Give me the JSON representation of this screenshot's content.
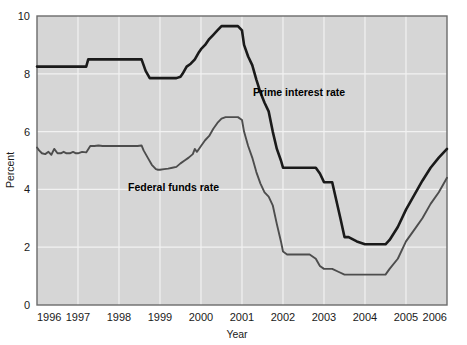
{
  "chart_data": {
    "type": "line",
    "title": "",
    "subtitle": "",
    "xlabel": "Year",
    "ylabel": "Percent",
    "xlim": [
      1996,
      2006
    ],
    "ylim": [
      0,
      10
    ],
    "grid": true,
    "legend_position": "inline-annotations",
    "xticks": [
      "1996",
      "1997",
      "1998",
      "1999",
      "2000",
      "2001",
      "2002",
      "2003",
      "2004",
      "2005",
      "2006"
    ],
    "yticks": [
      "0",
      "2",
      "4",
      "6",
      "8",
      "10"
    ],
    "series": [
      {
        "name": "Prime interest rate",
        "color": "#1a1a1a",
        "annotation": "Prime interest rate",
        "x": [
          1996.0,
          1996.1,
          1996.2,
          1996.3,
          1996.4,
          1996.5,
          1996.6,
          1996.7,
          1996.8,
          1996.9,
          1997.0,
          1997.1,
          1997.2,
          1997.25,
          1997.3,
          1997.5,
          1997.7,
          1997.9,
          1998.0,
          1998.2,
          1998.4,
          1998.55,
          1998.65,
          1998.75,
          1998.85,
          1998.95,
          1999.0,
          1999.2,
          1999.4,
          1999.5,
          1999.55,
          1999.65,
          1999.75,
          1999.85,
          1999.95,
          2000.0,
          2000.1,
          2000.2,
          2000.3,
          2000.4,
          2000.5,
          2000.6,
          2000.75,
          2000.9,
          2001.0,
          2001.05,
          2001.15,
          2001.25,
          2001.35,
          2001.45,
          2001.55,
          2001.65,
          2001.75,
          2001.85,
          2001.95,
          2002.0,
          2002.2,
          2002.4,
          2002.6,
          2002.8,
          2002.9,
          2003.0,
          2003.05,
          2003.2,
          2003.4,
          2003.5,
          2003.6,
          2003.8,
          2004.0,
          2004.2,
          2004.4,
          2004.5,
          2004.6,
          2004.8,
          2005.0,
          2005.2,
          2005.4,
          2005.6,
          2005.8,
          2006.0
        ],
        "values": [
          8.25,
          8.25,
          8.25,
          8.25,
          8.25,
          8.25,
          8.25,
          8.25,
          8.25,
          8.25,
          8.25,
          8.25,
          8.25,
          8.5,
          8.5,
          8.5,
          8.5,
          8.5,
          8.5,
          8.5,
          8.5,
          8.5,
          8.1,
          7.85,
          7.85,
          7.85,
          7.85,
          7.85,
          7.85,
          7.9,
          8.0,
          8.25,
          8.35,
          8.5,
          8.75,
          8.85,
          9.0,
          9.2,
          9.35,
          9.5,
          9.65,
          9.65,
          9.65,
          9.65,
          9.5,
          9.0,
          8.6,
          8.3,
          7.8,
          7.35,
          7.0,
          6.7,
          6.0,
          5.4,
          5.0,
          4.75,
          4.75,
          4.75,
          4.75,
          4.75,
          4.55,
          4.25,
          4.25,
          4.25,
          3.0,
          2.35,
          2.35,
          2.2,
          2.1,
          2.1,
          2.1,
          2.1,
          2.25,
          2.7,
          3.3,
          3.8,
          4.3,
          4.75,
          5.1,
          5.4
        ]
      },
      {
        "name": "Federal funds rate",
        "color": "#4d4d4d",
        "annotation": "Federal funds rate",
        "x": [
          1996.0,
          1996.05,
          1996.12,
          1996.2,
          1996.28,
          1996.35,
          1996.42,
          1996.5,
          1996.58,
          1996.65,
          1996.72,
          1996.8,
          1996.88,
          1996.95,
          1997.0,
          1997.1,
          1997.2,
          1997.3,
          1997.4,
          1997.5,
          1997.6,
          1997.75,
          1997.9,
          1998.0,
          1998.15,
          1998.3,
          1998.45,
          1998.55,
          1998.6,
          1998.7,
          1998.8,
          1998.9,
          1998.95,
          1999.0,
          1999.1,
          1999.2,
          1999.3,
          1999.4,
          1999.5,
          1999.6,
          1999.7,
          1999.8,
          1999.85,
          1999.9,
          1999.95,
          2000.0,
          2000.1,
          2000.2,
          2000.3,
          2000.4,
          2000.5,
          2000.6,
          2000.7,
          2000.8,
          2000.9,
          2001.0,
          2001.05,
          2001.15,
          2001.25,
          2001.35,
          2001.45,
          2001.55,
          2001.65,
          2001.75,
          2001.85,
          2001.95,
          2002.0,
          2002.1,
          2002.3,
          2002.5,
          2002.65,
          2002.8,
          2002.9,
          2003.0,
          2003.1,
          2003.2,
          2003.35,
          2003.5,
          2003.7,
          2003.9,
          2004.0,
          2004.2,
          2004.4,
          2004.5,
          2004.6,
          2004.8,
          2005.0,
          2005.2,
          2005.4,
          2005.6,
          2005.8,
          2006.0
        ],
        "values": [
          5.45,
          5.35,
          5.25,
          5.22,
          5.3,
          5.2,
          5.4,
          5.25,
          5.25,
          5.3,
          5.25,
          5.25,
          5.3,
          5.25,
          5.25,
          5.3,
          5.28,
          5.5,
          5.5,
          5.52,
          5.5,
          5.5,
          5.5,
          5.5,
          5.5,
          5.5,
          5.5,
          5.52,
          5.35,
          5.1,
          4.85,
          4.7,
          4.68,
          4.68,
          4.7,
          4.72,
          4.75,
          4.78,
          4.9,
          5.0,
          5.1,
          5.22,
          5.4,
          5.3,
          5.4,
          5.5,
          5.7,
          5.85,
          6.1,
          6.3,
          6.45,
          6.5,
          6.5,
          6.5,
          6.5,
          6.4,
          6.0,
          5.5,
          5.1,
          4.6,
          4.2,
          3.9,
          3.75,
          3.45,
          2.8,
          2.2,
          1.85,
          1.75,
          1.75,
          1.75,
          1.75,
          1.6,
          1.35,
          1.25,
          1.25,
          1.25,
          1.15,
          1.05,
          1.05,
          1.05,
          1.05,
          1.05,
          1.05,
          1.05,
          1.25,
          1.6,
          2.2,
          2.6,
          3.0,
          3.5,
          3.9,
          4.4
        ]
      }
    ]
  },
  "axes": {
    "y_title": "Percent",
    "x_title": "Year"
  },
  "colors": {
    "plot_background": "#d6d6d6",
    "gridline": "#f2f2f2",
    "border": "#6b6b6b",
    "prime_line": "#1a1a1a",
    "funds_line": "#4d4d4d"
  },
  "annotations": {
    "prime": "Prime interest rate",
    "funds": "Federal funds rate"
  }
}
